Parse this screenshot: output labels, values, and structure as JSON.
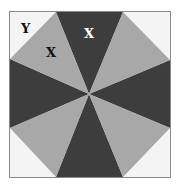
{
  "diagram": {
    "colors": {
      "background": "#ffffff",
      "corner": "#f4f4f4",
      "border": "#8a8a8a",
      "dark": "#3d3d3d",
      "light": "#a8a8a8",
      "label_on_dark": "#ffffff",
      "label_on_light": "#111111"
    },
    "labels": {
      "corner_region": "Y",
      "light_triangle": "X",
      "dark_triangle": "X"
    }
  }
}
